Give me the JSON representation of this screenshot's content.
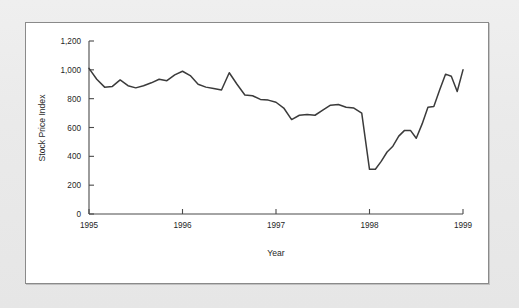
{
  "figure": {
    "background_color": "#ffffff",
    "page_color": "#ececec",
    "border_color": "#8a8a8a"
  },
  "chart_data": {
    "type": "line",
    "title": "",
    "xlabel": "Year",
    "ylabel": "Stock Price Index",
    "xlim": [
      1995,
      1999
    ],
    "ylim": [
      0,
      1200
    ],
    "grid": false,
    "legend": false,
    "line_color": "#3b3b3b",
    "x_tick_labels": [
      "1995",
      "1996",
      "1997",
      "1998",
      "1999"
    ],
    "x_ticks": [
      1995,
      1996,
      1997,
      1998,
      1999
    ],
    "y_tick_labels": [
      "0",
      "200",
      "400",
      "600",
      "800",
      "1,000",
      "1,200"
    ],
    "y_ticks": [
      0,
      200,
      400,
      600,
      800,
      1000,
      1200
    ],
    "series": [
      {
        "name": "Stock Price Index",
        "x": [
          1995.0,
          1995.083,
          1995.167,
          1995.25,
          1995.333,
          1995.417,
          1995.5,
          1995.583,
          1995.667,
          1995.75,
          1995.833,
          1995.917,
          1996.0,
          1996.083,
          1996.167,
          1996.25,
          1996.333,
          1996.417,
          1996.5,
          1996.583,
          1996.667,
          1996.75,
          1996.833,
          1996.917,
          1997.0,
          1997.083,
          1997.167,
          1997.25,
          1997.333,
          1997.417,
          1997.5,
          1997.583,
          1997.667,
          1997.75,
          1997.833,
          1997.917,
          1998.0,
          1998.083,
          1998.167,
          1998.25,
          1998.333,
          1998.417,
          1998.5,
          1998.583,
          1998.667,
          1998.75,
          1998.833,
          1998.917,
          1999.0
        ],
        "values": [
          1010,
          935,
          880,
          885,
          930,
          890,
          875,
          890,
          910,
          935,
          925,
          965,
          990,
          960,
          900,
          880,
          870,
          860,
          980,
          900,
          825,
          820,
          795,
          790,
          775,
          735,
          655,
          685,
          690,
          685,
          720,
          755,
          760,
          740,
          735,
          700,
          660,
          500,
          420,
          375,
          425,
          560,
          565,
          480,
          400,
          340,
          300,
          335,
          310
        ]
      }
    ],
    "annotations": []
  },
  "chart_tail": {
    "x": [
      1998.0,
      1998.063,
      1998.125,
      1998.188,
      1998.25,
      1998.313,
      1998.375,
      1998.438,
      1998.5,
      1998.563,
      1998.625,
      1998.688,
      1998.75,
      1998.813,
      1998.875,
      1998.938,
      1999.0
    ],
    "values": [
      310,
      310,
      365,
      430,
      470,
      540,
      580,
      580,
      525,
      625,
      740,
      745,
      860,
      970,
      955,
      850,
      1000
    ]
  }
}
